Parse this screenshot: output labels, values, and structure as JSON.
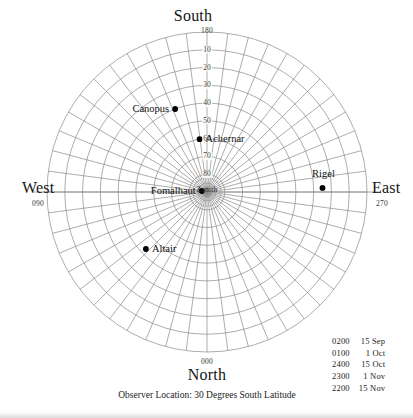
{
  "figure": {
    "caption": "Observer Location: 30 Degrees South Latitude",
    "center_label": "Zenith"
  },
  "cardinals": {
    "south": {
      "name": "South",
      "azimuth": "180"
    },
    "north": {
      "name": "North",
      "azimuth": "000"
    },
    "west": {
      "name": "West",
      "azimuth": "090"
    },
    "east": {
      "name": "East",
      "azimuth": "270"
    }
  },
  "legend": {
    "rows": [
      {
        "time": "0200",
        "date": "15 Sep"
      },
      {
        "time": "0100",
        "date": "1 Oct"
      },
      {
        "time": "2400",
        "date": "15 Oct"
      },
      {
        "time": "2300",
        "date": "1 Nov"
      },
      {
        "time": "2200",
        "date": "15 Nov"
      }
    ]
  },
  "chart_data": {
    "type": "scatter",
    "projection": "azimuthal-equidistant-zenith-centered",
    "title": "",
    "subtitle": "",
    "xlabel": "",
    "ylabel": "",
    "grid": true,
    "legend_position": "bottom-right",
    "center": {
      "label": "Zenith",
      "altitude": 90
    },
    "radial_axis": {
      "label": "Altitude (degrees)",
      "tick_labels": [
        "10",
        "20",
        "30",
        "40",
        "50",
        "60",
        "70",
        "80"
      ],
      "values": [
        10,
        20,
        30,
        40,
        50,
        60,
        70,
        80
      ],
      "range": [
        0,
        90
      ],
      "tick_direction": "toward South (up)",
      "horizon_label": "180"
    },
    "angular_axis": {
      "label": "Azimuth (degrees)",
      "tick_labels": [
        "180",
        "090",
        "000",
        "270"
      ],
      "values": [
        180,
        90,
        0,
        270
      ],
      "tick_names": [
        "South",
        "West",
        "North",
        "East"
      ],
      "spoke_interval_deg": 7.5,
      "ring_interval_deg": 10
    },
    "series": [
      {
        "name": "Stars",
        "points": [
          {
            "name": "Canopus",
            "azimuth": 159,
            "altitude": 40,
            "label_side": "left"
          },
          {
            "name": "Achernar",
            "azimuth": 172,
            "altitude": 60,
            "label_side": "right"
          },
          {
            "name": "Fomalhaut",
            "azimuth": 101,
            "altitude": 87,
            "label_side": "left"
          },
          {
            "name": "Rigel",
            "azimuth": 268,
            "altitude": 25,
            "label_side": "above"
          },
          {
            "name": "Altair",
            "azimuth": 47,
            "altitude": 43,
            "label_side": "right"
          }
        ]
      }
    ]
  }
}
